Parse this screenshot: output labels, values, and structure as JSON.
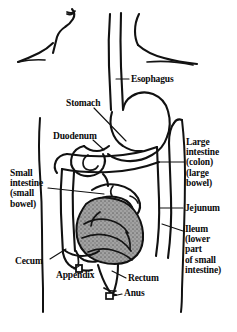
{
  "figure": {
    "type": "anatomical-line-drawing",
    "background_color": "#ffffff",
    "line_color": "#111111",
    "shading_color": "#9a9a9a"
  },
  "labels": {
    "esophagus": "Esophagus",
    "stomach": "Stomach",
    "duodenum": "Duodenum",
    "large_intestine": "Large\nintestine\n(colon)\n(large\nbowel)",
    "small_intestine": "Small\nintestine\n(small\nbowel)",
    "jejunum": "Jejunum",
    "ileum": "Ileum\n(lower\npart\nof small\nintestine)",
    "cecum": "Cecum",
    "appendix": "Appendix",
    "rectum": "Rectum",
    "anus": "Anus"
  },
  "parts": [
    {
      "id": "esophagus",
      "name": "Esophagus",
      "shaded": false
    },
    {
      "id": "stomach",
      "name": "Stomach",
      "shaded": false
    },
    {
      "id": "duodenum",
      "name": "Duodenum",
      "shaded": false
    },
    {
      "id": "large-intestine",
      "name": "Large intestine",
      "shaded": false
    },
    {
      "id": "small-intestine",
      "name": "Small intestine",
      "shaded": false
    },
    {
      "id": "jejunum",
      "name": "Jejunum",
      "shaded": false
    },
    {
      "id": "ileum",
      "name": "Ileum",
      "shaded": true
    },
    {
      "id": "cecum",
      "name": "Cecum",
      "shaded": false
    },
    {
      "id": "appendix",
      "name": "Appendix",
      "shaded": false
    },
    {
      "id": "rectum",
      "name": "Rectum",
      "shaded": false
    },
    {
      "id": "anus",
      "name": "Anus",
      "shaded": false
    }
  ]
}
